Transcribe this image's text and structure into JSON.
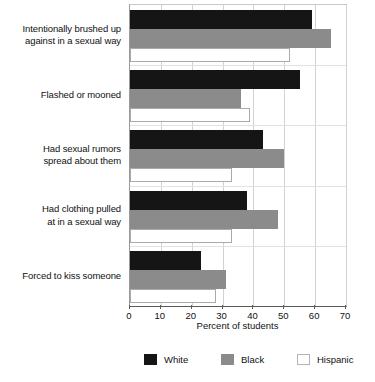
{
  "chart_data": {
    "type": "bar",
    "orientation": "horizontal",
    "title": "",
    "subtitle": "",
    "xlabel": "Percent of students",
    "ylabel": "",
    "xlim": [
      0,
      70
    ],
    "xticks": [
      0,
      10,
      20,
      30,
      40,
      50,
      60,
      70
    ],
    "xtick_labels": [
      "0",
      "10",
      "20",
      "30",
      "40",
      "50",
      "60",
      "70"
    ],
    "grid": true,
    "legend_position": "bottom",
    "categories": [
      "Intentionally brushed up against in a sexual way",
      "Flashed or mooned",
      "Had sexual rumors spread about them",
      "Had clothing pulled at in a sexual way",
      "Forced to kiss someone"
    ],
    "category_lines": [
      [
        "Intentionally brushed up",
        "against in a sexual way"
      ],
      [
        "Flashed or mooned"
      ],
      [
        "Had sexual rumors",
        "spread about them"
      ],
      [
        "Had clothing pulled",
        "at in a sexual way"
      ],
      [
        "Forced to kiss someone"
      ]
    ],
    "series": [
      {
        "name": "White",
        "color": "#151515",
        "values": [
          59,
          55,
          43,
          38,
          23
        ]
      },
      {
        "name": "Black",
        "color": "#8b8b8b",
        "values": [
          65,
          36,
          50,
          48,
          31
        ]
      },
      {
        "name": "Hispanic",
        "color": "#ffffff",
        "values": [
          52,
          39,
          33,
          33,
          28
        ]
      }
    ]
  },
  "legend": {
    "items": [
      {
        "label": "White",
        "swatch": "legend-swatch-white"
      },
      {
        "label": "Black",
        "swatch": "legend-swatch-black"
      },
      {
        "label": "Hispanic",
        "swatch": "legend-swatch-hispanic"
      }
    ]
  },
  "axis": {
    "x_title": "Percent of students"
  }
}
